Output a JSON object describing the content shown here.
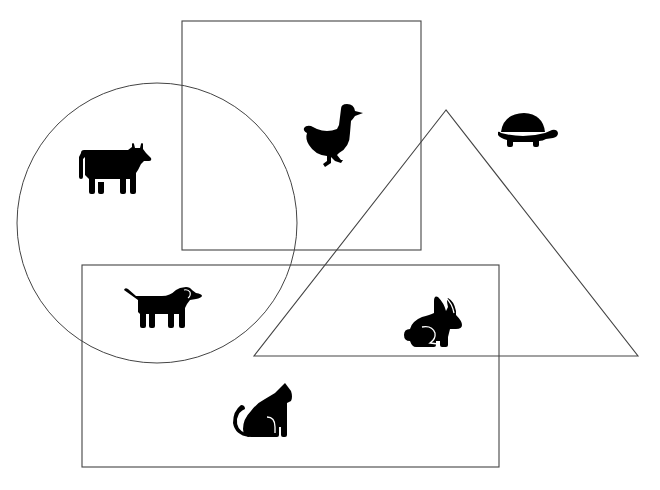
{
  "diagram": {
    "width": 660,
    "height": 490,
    "background": "#ffffff",
    "stroke_color": "#444444",
    "icon_color": "#000000",
    "shapes": [
      {
        "id": "top-rectangle",
        "type": "rect",
        "x": 182,
        "y": 21,
        "w": 239,
        "h": 229
      },
      {
        "id": "left-circle",
        "type": "circle",
        "cx": 157,
        "cy": 223,
        "r": 140
      },
      {
        "id": "triangle",
        "type": "triangle",
        "points": [
          [
            446,
            110
          ],
          [
            254,
            356
          ],
          [
            638,
            356
          ]
        ]
      },
      {
        "id": "bottom-rectangle",
        "type": "rect",
        "x": 82,
        "y": 265,
        "w": 417,
        "h": 202
      }
    ],
    "animals": [
      {
        "name": "cow",
        "cx": 114,
        "cy": 170,
        "regions": [
          "left-circle"
        ]
      },
      {
        "name": "duck",
        "cx": 333,
        "cy": 135,
        "regions": [
          "top-rectangle"
        ]
      },
      {
        "name": "turtle",
        "cx": 527,
        "cy": 128,
        "regions": []
      },
      {
        "name": "dog",
        "cx": 162,
        "cy": 306,
        "regions": [
          "left-circle",
          "bottom-rectangle"
        ]
      },
      {
        "name": "rabbit",
        "cx": 433,
        "cy": 320,
        "regions": [
          "triangle",
          "bottom-rectangle"
        ]
      },
      {
        "name": "cat",
        "cx": 262,
        "cy": 414,
        "regions": [
          "bottom-rectangle"
        ]
      }
    ]
  }
}
